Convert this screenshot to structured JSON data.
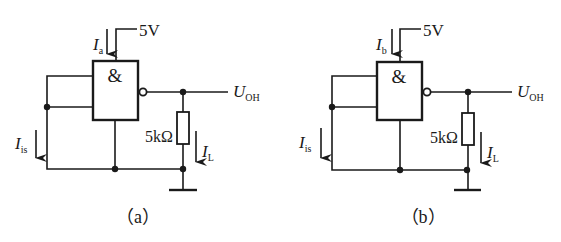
{
  "diagram": {
    "type": "circuit-schematic",
    "circuits": [
      {
        "id": "a",
        "caption": "（a）",
        "supply_voltage": "5V",
        "supply_current": {
          "symbol": "I",
          "subscript": "a"
        },
        "gate_symbol": "&",
        "gate_type": "NAND",
        "input_current": {
          "symbol": "I",
          "subscript": "is"
        },
        "output_voltage": {
          "symbol": "U",
          "subscript": "OH"
        },
        "load_resistor": "5kΩ",
        "load_current": {
          "symbol": "I",
          "subscript": "L"
        },
        "inputs_connection": "tied together to ground"
      },
      {
        "id": "b",
        "caption": "（b）",
        "supply_voltage": "5V",
        "supply_current": {
          "symbol": "I",
          "subscript": "b"
        },
        "gate_symbol": "&",
        "gate_type": "NAND",
        "input_current": {
          "symbol": "I",
          "subscript": "is"
        },
        "output_voltage": {
          "symbol": "U",
          "subscript": "OH"
        },
        "load_resistor": "5kΩ",
        "load_current": {
          "symbol": "I",
          "subscript": "L"
        },
        "inputs_connection": "tied together to ground"
      }
    ]
  }
}
